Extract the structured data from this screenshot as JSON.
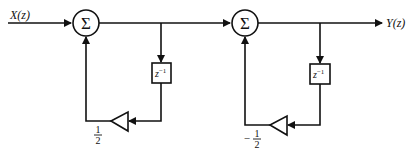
{
  "diagram": {
    "type": "signal-flow block diagram",
    "input_label": "X(z)",
    "output_label": "Y(z)",
    "stage1": {
      "summer_symbol": "Σ",
      "delay_label": "z",
      "delay_exp": "−1",
      "gain_num": "1",
      "gain_den": "2",
      "gain_sign": ""
    },
    "stage2": {
      "summer_symbol": "Σ",
      "delay_label": "z",
      "delay_exp": "−1",
      "gain_num": "1",
      "gain_den": "2",
      "gain_sign": "−"
    },
    "colors": {
      "stroke": "#111111",
      "background": "#ffffff"
    }
  }
}
